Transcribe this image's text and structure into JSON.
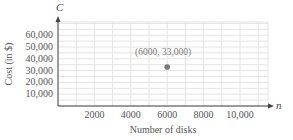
{
  "chart_data": {
    "type": "scatter",
    "title": "",
    "xlabel": "Number of disks",
    "ylabel": "Cost (in $)",
    "x_axis_var": "n",
    "y_axis_var": "C",
    "x_ticks": [
      "2000",
      "4000",
      "6000",
      "8000",
      "10,000"
    ],
    "x_tick_values": [
      2000,
      4000,
      6000,
      8000,
      10000
    ],
    "y_ticks": [
      "10,000",
      "20,000",
      "30,000",
      "40,000",
      "50,000",
      "60,000"
    ],
    "y_tick_values": [
      10000,
      20000,
      30000,
      40000,
      50000,
      60000
    ],
    "xlim": [
      0,
      12000
    ],
    "ylim": [
      0,
      70000
    ],
    "grid": true,
    "points": [
      {
        "x": 6000,
        "y": 33000,
        "label": "(6000, 33,000)"
      }
    ],
    "colors": {
      "point": "#7a7a7a",
      "grid": "#e4e4e4",
      "axis": "#444444"
    }
  }
}
